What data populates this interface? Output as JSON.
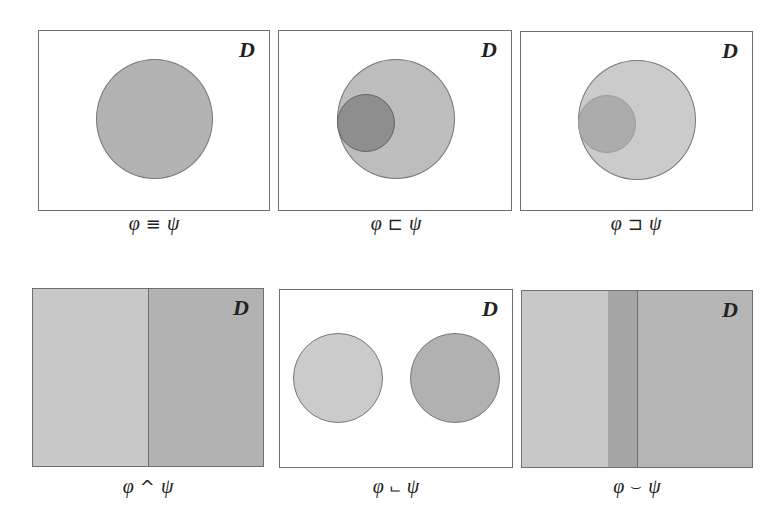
{
  "domain_label": "D",
  "colors": {
    "border": "#6f6f6f",
    "white": "#ffffff",
    "light_gray": "#c9c9c9",
    "mid_gray": "#b4b4b4",
    "dark_gray": "#8f8f8f",
    "overlap_gray": "#a6a6a6"
  },
  "panels": [
    {
      "id": "equivalent",
      "domain": "D",
      "caption": {
        "left": "φ",
        "op": "≡",
        "right": "ψ"
      },
      "description": "single circle: φ and ψ coincide"
    },
    {
      "id": "subsumed",
      "domain": "D",
      "caption": {
        "left": "φ",
        "op": "⊏",
        "right": "ψ"
      },
      "description": "small dark circle φ inside larger circle ψ"
    },
    {
      "id": "subsumes",
      "domain": "D",
      "caption": {
        "left": "φ",
        "op": "⊐",
        "right": "ψ"
      },
      "description": "small circle ψ inside larger lighter circle φ"
    },
    {
      "id": "complementary",
      "domain": "D",
      "caption": {
        "left": "φ",
        "op": "^",
        "right": "ψ"
      },
      "description": "domain split into two halves"
    },
    {
      "id": "disjoint",
      "domain": "D",
      "caption": {
        "left": "φ",
        "op": "⨽",
        "right": "ψ"
      },
      "description": "two separate circles"
    },
    {
      "id": "overlapping-cover",
      "domain": "D",
      "caption": {
        "left": "φ",
        "op": "⌣",
        "right": "ψ"
      },
      "description": "domain covered by two overlapping regions"
    }
  ]
}
